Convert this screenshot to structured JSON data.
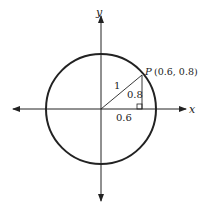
{
  "diagram": {
    "type": "unit-circle",
    "axes": {
      "x_label": "x",
      "y_label": "y"
    },
    "point": {
      "name": "P",
      "coords_label": "(0.6, 0.8)",
      "x": 0.6,
      "y": 0.8
    },
    "segments": {
      "radius_label": "1",
      "vertical_label": "0.8",
      "horizontal_label": "0.6"
    },
    "colors": {
      "stroke": "#222222",
      "background": "#ffffff"
    }
  }
}
